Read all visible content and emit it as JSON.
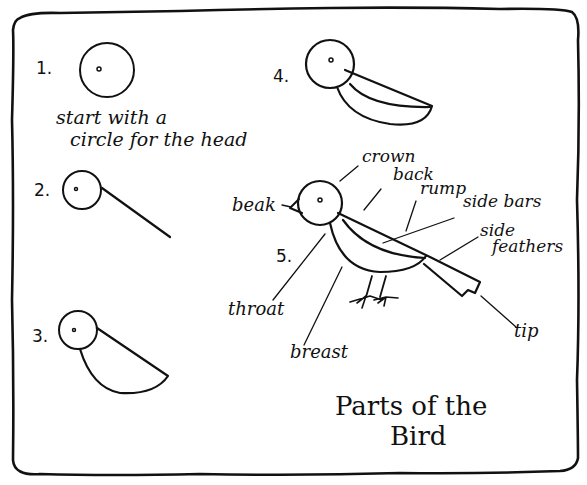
{
  "title_line1": "Parts of the",
  "title_line2": "Bird",
  "steps": [
    {
      "number": "1.",
      "caption_line1": "start with a",
      "caption_line2": "circle for the head"
    },
    {
      "number": "2.",
      "caption_line1": "",
      "caption_line2": ""
    },
    {
      "number": "3.",
      "caption_line1": "",
      "caption_line2": ""
    },
    {
      "number": "4.",
      "caption_line1": "",
      "caption_line2": ""
    },
    {
      "number": "5.",
      "caption_line1": "",
      "caption_line2": ""
    }
  ],
  "labels": {
    "crown": "crown",
    "back": "back",
    "rump": "rump",
    "side_bars": "side bars",
    "side_feathers_1": "side",
    "side_feathers_2": "feathers",
    "beak": "beak",
    "throat": "throat",
    "breast": "breast",
    "tip": "tip"
  },
  "colors": {
    "ink": "#111111",
    "paper": "#ffffff"
  }
}
